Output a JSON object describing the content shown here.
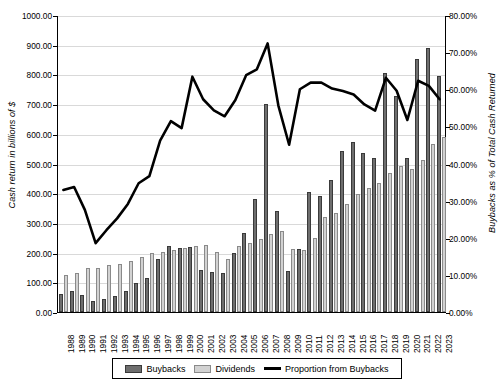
{
  "chart_data": {
    "type": "bar",
    "title": "",
    "xlabel": "",
    "ylabel": "Cash return in billions of $",
    "y2label": "Buybacks as % of Total Cash Returned",
    "ylim": [
      0,
      1000
    ],
    "y2lim": [
      0,
      0.8
    ],
    "grid": true,
    "legend_position": "bottom",
    "categories": [
      "1988",
      "1989",
      "1990",
      "1991",
      "1992",
      "1993",
      "1994",
      "1995",
      "1996",
      "1997",
      "1998",
      "1999",
      "2000",
      "2001",
      "2002",
      "2003",
      "2004",
      "2005",
      "2006",
      "2007",
      "2008",
      "2009",
      "2010",
      "2011",
      "2012",
      "2013",
      "2014",
      "2015",
      "2016",
      "2017",
      "2018",
      "2019",
      "2020",
      "2021",
      "2022",
      "2023"
    ],
    "y_ticks": [
      "0.00",
      "100.00",
      "200.00",
      "300.00",
      "400.00",
      "500.00",
      "600.00",
      "700.00",
      "800.00",
      "900.00",
      "1000.00"
    ],
    "y2_ticks": [
      "0.00%",
      "10.00%",
      "20.00%",
      "30.00%",
      "40.00%",
      "50.00%",
      "60.00%",
      "70.00%",
      "80.00%"
    ],
    "series": [
      {
        "name": "Buybacks",
        "axis": "left",
        "color": "#6e6e6e",
        "values": [
          62,
          70,
          56,
          37,
          45,
          55,
          72,
          99,
          116,
          177,
          222,
          214,
          218,
          142,
          135,
          130,
          199,
          265,
          380,
          700,
          340,
          137,
          212,
          405,
          390,
          444,
          543,
          571,
          536,
          519,
          806,
          728,
          520,
          853,
          889,
          795
        ]
      },
      {
        "name": "Dividends",
        "axis": "left",
        "color": "#d2d2d2",
        "values": [
          126,
          131,
          147,
          148,
          157,
          162,
          173,
          186,
          200,
          203,
          208,
          217,
          222,
          227,
          203,
          180,
          222,
          231,
          247,
          264,
          272,
          212,
          210,
          248,
          320,
          332,
          363,
          397,
          418,
          436,
          467,
          490,
          482,
          512,
          565,
          588
        ]
      },
      {
        "name": "Proportion from Buybacks",
        "axis": "right",
        "color": "#000000",
        "values": [
          0.33,
          0.338,
          0.276,
          0.186,
          0.221,
          0.253,
          0.292,
          0.348,
          0.367,
          0.463,
          0.516,
          0.497,
          0.636,
          0.575,
          0.545,
          0.529,
          0.573,
          0.64,
          0.656,
          0.726,
          0.558,
          0.452,
          0.602,
          0.62,
          0.62,
          0.604,
          0.597,
          0.588,
          0.561,
          0.544,
          0.633,
          0.598,
          0.519,
          0.625,
          0.611,
          0.575
        ]
      }
    ]
  },
  "legend": {
    "items": [
      {
        "label": "Buybacks",
        "type": "swatch-dark"
      },
      {
        "label": "Dividends",
        "type": "swatch-light"
      },
      {
        "label": "Proportion from Buybacks",
        "type": "line"
      }
    ]
  }
}
